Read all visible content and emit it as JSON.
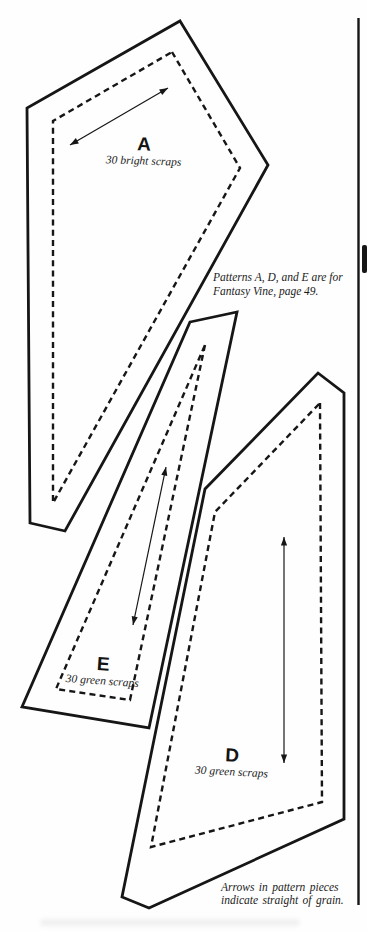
{
  "ink": "#161616",
  "paper": "#fefefe",
  "pieces": [
    {
      "id": "a",
      "label": "A",
      "caption": "30 bright scraps",
      "outline": [
        [
          180,
          21
        ],
        [
          268,
          165
        ],
        [
          65,
          531
        ],
        [
          30,
          523
        ],
        [
          27,
          108
        ]
      ],
      "seam": [
        [
          172,
          52
        ],
        [
          240,
          168
        ],
        [
          53,
          503
        ],
        [
          53,
          121
        ]
      ],
      "grain_arrow": [
        [
          70,
          145
        ],
        [
          168,
          88
        ]
      ],
      "label_pos": [
        142,
        142
      ],
      "caption_pos": [
        145,
        160
      ],
      "rotation_deg": 2
    },
    {
      "id": "e",
      "label": "E",
      "caption": "30 green scraps",
      "outline": [
        [
          190,
          322
        ],
        [
          237,
          312
        ],
        [
          149,
          728
        ],
        [
          22,
          707
        ]
      ],
      "seam": [
        [
          205,
          345
        ],
        [
          130,
          700
        ],
        [
          56,
          689
        ]
      ],
      "grain_arrow": [
        [
          166,
          467
        ],
        [
          133,
          625
        ]
      ],
      "label_pos": [
        102,
        661
      ],
      "caption_pos": [
        103,
        680
      ],
      "rotation_deg": 4
    },
    {
      "id": "d",
      "label": "D",
      "caption": "30 green scraps",
      "outline": [
        [
          318,
          373
        ],
        [
          344,
          393
        ],
        [
          344,
          819
        ],
        [
          149,
          908
        ],
        [
          122,
          897
        ],
        [
          205,
          489
        ]
      ],
      "seam": [
        [
          320,
          403
        ],
        [
          322,
          802
        ],
        [
          151,
          847
        ],
        [
          215,
          512
        ]
      ],
      "grain_arrow": [
        [
          284,
          537
        ],
        [
          284,
          763
        ]
      ],
      "label_pos": [
        233,
        752
      ],
      "caption_pos": [
        231,
        771
      ],
      "rotation_deg": 3
    }
  ],
  "notes": {
    "patterns": [
      "Patterns A, D, and E are for",
      "Fantasy Vine, page 49."
    ],
    "grain": [
      "Arrows in pattern pieces",
      "indicate straight of grain."
    ]
  },
  "column_rule": {
    "x": 358.5,
    "y1": 18,
    "y2": 905
  },
  "edge_tab": {
    "x": 362,
    "y": 245,
    "w": 5,
    "h": 28
  },
  "stroke": {
    "outline_w": 2.8,
    "seam_w": 2.4,
    "seam_dash": "6 4.2",
    "arrow_w": 1.2,
    "rule_w": 2.4
  }
}
